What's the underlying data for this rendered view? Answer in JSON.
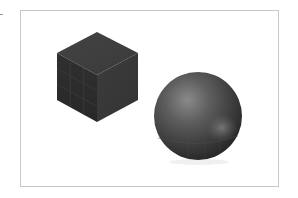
{
  "scene": {
    "background": "#ffffff",
    "frame": {
      "border_color": "#c8c8c8"
    },
    "objects": [
      {
        "type": "cube",
        "name": "dark-cube",
        "colors": {
          "top": "#3f3f3f",
          "left": "#2e2e2e",
          "right": "#383838",
          "grid_line": "#4a4a4a"
        },
        "grid_divisions": 3
      },
      {
        "type": "sphere",
        "name": "dark-sphere",
        "colors": {
          "highlight": "#8a8a8a",
          "mid": "#5a5a5a",
          "shadow": "#262626",
          "reflection": "#7a7a7a"
        }
      }
    ]
  }
}
